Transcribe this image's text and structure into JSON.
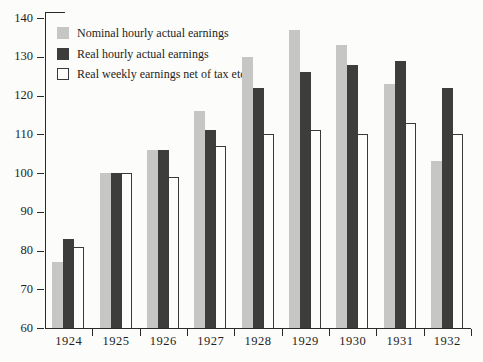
{
  "chart_data": {
    "type": "bar",
    "title": "",
    "xlabel": "",
    "ylabel": "",
    "categories": [
      "1924",
      "1925",
      "1926",
      "1927",
      "1928",
      "1929",
      "1930",
      "1931",
      "1932"
    ],
    "series": [
      {
        "name": "Nominal hourly actual earnings",
        "values": [
          77,
          100,
          106,
          116,
          130,
          137,
          133,
          123,
          103
        ],
        "fill": "#c6c6c4",
        "stroke": "none"
      },
      {
        "name": "Real hourly actual earnings",
        "values": [
          83,
          100,
          106,
          111,
          122,
          126,
          128,
          129,
          122
        ],
        "fill": "#3d3d3c",
        "stroke": "none"
      },
      {
        "name": "Real weekly earnings net of tax etc.",
        "values": [
          81,
          100,
          99,
          107,
          110,
          111,
          110,
          113,
          110
        ],
        "fill": "#fdfdfc",
        "stroke": "#3a3a3a"
      }
    ],
    "ylim": [
      60,
      140
    ],
    "yticks": [
      60,
      70,
      80,
      90,
      100,
      110,
      120,
      130,
      140
    ],
    "grid": false,
    "legend_position": "top-left",
    "axis_color": "#2a2a28",
    "text_color": "#1e1e1c",
    "background": "#fcfcfa"
  }
}
